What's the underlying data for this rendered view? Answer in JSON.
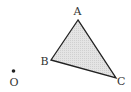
{
  "diagram": {
    "type": "geometry",
    "triangle": {
      "vertices": [
        "A",
        "B",
        "C"
      ],
      "fill_color": "#dcdcdc",
      "stroke_color": "#222222"
    },
    "points": [
      {
        "id": "A",
        "label": "A"
      },
      {
        "id": "B",
        "label": "B"
      },
      {
        "id": "C",
        "label": "C"
      },
      {
        "id": "O",
        "label": "O",
        "marked_with_dot": true
      }
    ]
  }
}
